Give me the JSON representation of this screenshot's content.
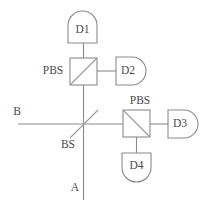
{
  "diagram": {
    "type": "optical-schematic",
    "canvas": {
      "width": 211,
      "height": 207
    },
    "colors": {
      "background": "#ffffff",
      "line": "#8a8a8a",
      "diagonal": "#9a9a9a",
      "text": "#4a4a4a"
    },
    "detectors": [
      {
        "id": "D1",
        "label": "D1",
        "orientation": "up",
        "body": {
          "x": 68,
          "y": 11,
          "width": 29,
          "height": 32
        },
        "dome_radius": 14.5,
        "label_x": 82.5,
        "label_y": 29
      },
      {
        "id": "D2",
        "label": "D2",
        "orientation": "right",
        "body": {
          "x": 115,
          "y": 57,
          "width": 31,
          "height": 28
        },
        "dome_radius": 14,
        "label_x": 127,
        "label_y": 71
      },
      {
        "id": "D3",
        "label": "D3",
        "orientation": "right",
        "body": {
          "x": 167,
          "y": 110,
          "width": 31,
          "height": 28
        },
        "dome_radius": 14,
        "label_x": 179,
        "label_y": 124
      },
      {
        "id": "D4",
        "label": "D4",
        "orientation": "down",
        "body": {
          "x": 122,
          "y": 152,
          "width": 29,
          "height": 30
        },
        "dome_radius": 14.5,
        "label_x": 136.5,
        "label_y": 166
      }
    ],
    "components": [
      {
        "id": "pbs-left",
        "label": "PBS",
        "kind": "polarizing-beam-splitter",
        "box": {
          "x": 70,
          "y": 58,
          "width": 27,
          "height": 27
        },
        "diagonal": "bottom-left-to-top-right",
        "label_x": 53,
        "label_y": 71,
        "label_position": "left"
      },
      {
        "id": "pbs-right",
        "label": "PBS",
        "kind": "polarizing-beam-splitter",
        "box": {
          "x": 123,
          "y": 110,
          "width": 27,
          "height": 27
        },
        "diagonal": "top-left-to-bottom-right",
        "label_x": 140,
        "label_y": 101,
        "label_position": "top"
      },
      {
        "id": "bs",
        "label": "BS",
        "kind": "beam-splitter",
        "diagonal_line": {
          "x1": 70,
          "y1": 138,
          "x2": 98,
          "y2": 110
        },
        "center": {
          "x": 84,
          "y": 124
        },
        "label_x": 68,
        "label_y": 145,
        "label_position": "bottom-left"
      }
    ],
    "ports": [
      {
        "id": "port-a",
        "label": "A",
        "label_x": 75,
        "label_y": 187,
        "description": "input port A, bottom vertical beam"
      },
      {
        "id": "port-b",
        "label": "B",
        "label_x": 17,
        "label_y": 112,
        "description": "input port B, left horizontal beam"
      }
    ],
    "beams": [
      {
        "id": "beam-pbs-left-to-d1",
        "x1": 83.5,
        "y1": 43,
        "x2": 83.5,
        "y2": 58
      },
      {
        "id": "beam-pbs-left-to-d2",
        "x1": 97,
        "y1": 71,
        "x2": 115,
        "y2": 71
      },
      {
        "id": "beam-bs-to-pbs-left",
        "x1": 83.5,
        "y1": 85,
        "x2": 83.5,
        "y2": 124
      },
      {
        "id": "beam-a-to-bs",
        "x1": 83.5,
        "y1": 124,
        "x2": 83.5,
        "y2": 200
      },
      {
        "id": "beam-b-to-bs",
        "x1": 18,
        "y1": 124,
        "x2": 123,
        "y2": 124
      },
      {
        "id": "beam-pbs-right-to-d3",
        "x1": 150,
        "y1": 124,
        "x2": 167,
        "y2": 124
      },
      {
        "id": "beam-pbs-right-to-d4",
        "x1": 136.5,
        "y1": 137,
        "x2": 136.5,
        "y2": 152
      }
    ]
  }
}
